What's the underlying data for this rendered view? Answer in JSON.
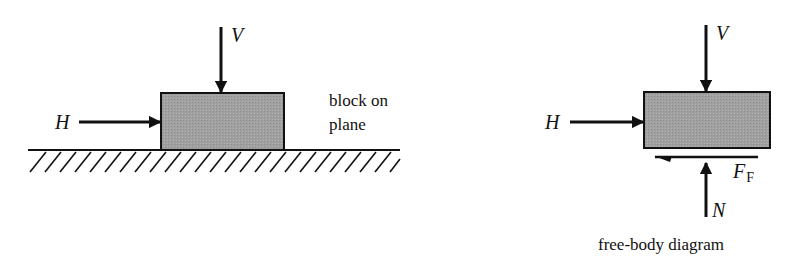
{
  "figure": {
    "background": "#ffffff",
    "block_fill": "#9e9e9e",
    "line_color": "#111111",
    "left_panel": {
      "caption_line1": "block on",
      "caption_line2": "plane",
      "labels": {
        "vertical_force": "V",
        "horizontal_force": "H"
      }
    },
    "right_panel": {
      "caption": "free-body diagram",
      "labels": {
        "vertical_force": "V",
        "horizontal_force": "H",
        "friction_force": "F",
        "friction_subscript": "F",
        "normal_force": "N"
      }
    }
  }
}
